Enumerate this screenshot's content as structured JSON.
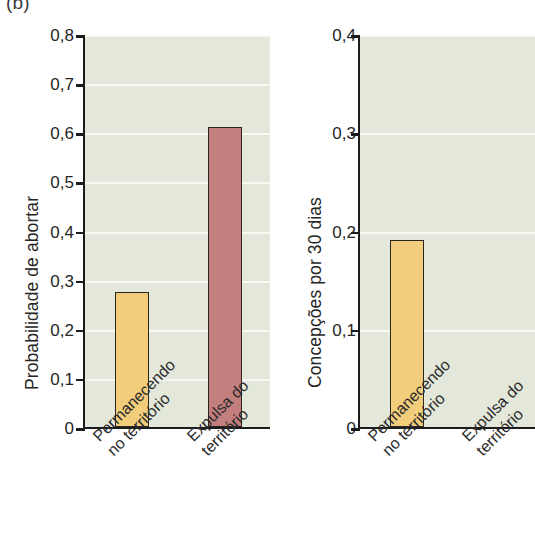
{
  "figure": {
    "panel_label": "(b)",
    "background": "#ffffff",
    "plot_background": "#e4e8da",
    "gridline_color": "#f7f9f2",
    "axis_color": "#1c1c1c"
  },
  "colors": {
    "bar_yellow": "#f2ce7c",
    "bar_red": "#c37e7e",
    "bar_outline": "#2a2520"
  },
  "chart_data": [
    {
      "type": "bar",
      "id": "left",
      "title": "",
      "xlabel": "",
      "ylabel": "Probabilidade de abortar",
      "categories": [
        "Permanecendo no território",
        "Expulsa do território"
      ],
      "category_lines": [
        [
          "Permanecendo",
          "no território"
        ],
        [
          "Expulsa do",
          "território"
        ]
      ],
      "values": [
        0.275,
        0.61
      ],
      "bar_colors": [
        "#f2ce7c",
        "#c37e7e"
      ],
      "ylim": [
        0,
        0.8
      ],
      "ytick_values": [
        0,
        0.1,
        0.2,
        0.3,
        0.4,
        0.5,
        0.6,
        0.7,
        0.8
      ],
      "ytick_labels": [
        "0",
        "0,1",
        "0,2",
        "0,3",
        "0,4",
        "0,5",
        "0,6",
        "0,7",
        "0,8"
      ],
      "grid": true,
      "legend": "none"
    },
    {
      "type": "bar",
      "id": "right",
      "title": "",
      "xlabel": "",
      "ylabel": "Concepções por 30 dias",
      "categories": [
        "Permanecendo no território",
        "Expulsa do território"
      ],
      "category_lines": [
        [
          "Permanecendo",
          "no território"
        ],
        [
          "Expulsa do",
          "território"
        ]
      ],
      "values": [
        0.19,
        0
      ],
      "bar_colors": [
        "#f2ce7c",
        "#c37e7e"
      ],
      "ylim": [
        0,
        0.4
      ],
      "ytick_values": [
        0,
        0.1,
        0.2,
        0.3,
        0.4
      ],
      "ytick_labels": [
        "0",
        "0,1",
        "0,2",
        "0,3",
        "0,4"
      ],
      "grid": true,
      "legend": "none"
    }
  ]
}
